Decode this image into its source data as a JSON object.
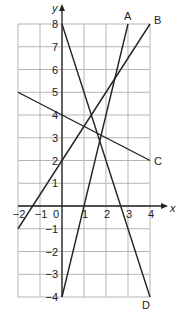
{
  "chart_data": {
    "type": "line",
    "title": "",
    "xlabel": "x",
    "ylabel": "y",
    "xlim": [
      -2,
      4
    ],
    "ylim": [
      -4,
      8
    ],
    "grid": true,
    "x_ticks": [
      "-2",
      "-1",
      "0",
      "1",
      "2",
      "3",
      "4"
    ],
    "y_ticks": [
      "-4",
      "-3",
      "-2",
      "-1",
      "1",
      "2",
      "3",
      "4",
      "5",
      "6",
      "7",
      "8"
    ],
    "series": [
      {
        "name": "A",
        "points": [
          [
            0,
            -4
          ],
          [
            3,
            8
          ]
        ]
      },
      {
        "name": "B",
        "points": [
          [
            -2,
            -1
          ],
          [
            4,
            8
          ]
        ]
      },
      {
        "name": "C",
        "points": [
          [
            -2,
            5
          ],
          [
            4,
            2
          ]
        ]
      },
      {
        "name": "D",
        "points": [
          [
            0,
            8
          ],
          [
            4,
            -4
          ]
        ]
      }
    ]
  }
}
